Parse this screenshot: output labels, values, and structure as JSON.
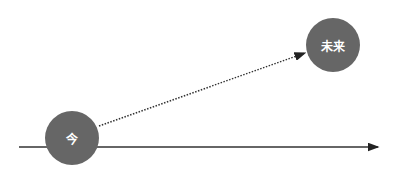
{
  "diagram": {
    "nodes": [
      {
        "id": "now",
        "label": "今"
      },
      {
        "id": "future",
        "label": "未来"
      }
    ],
    "edges": [
      {
        "from": "now",
        "to": "future",
        "style": "dotted",
        "arrow": true
      },
      {
        "type": "axis",
        "style": "solid",
        "arrow": true
      }
    ],
    "colors": {
      "node_fill": "#666666",
      "node_text": "#ffffff",
      "line": "#333333"
    }
  }
}
